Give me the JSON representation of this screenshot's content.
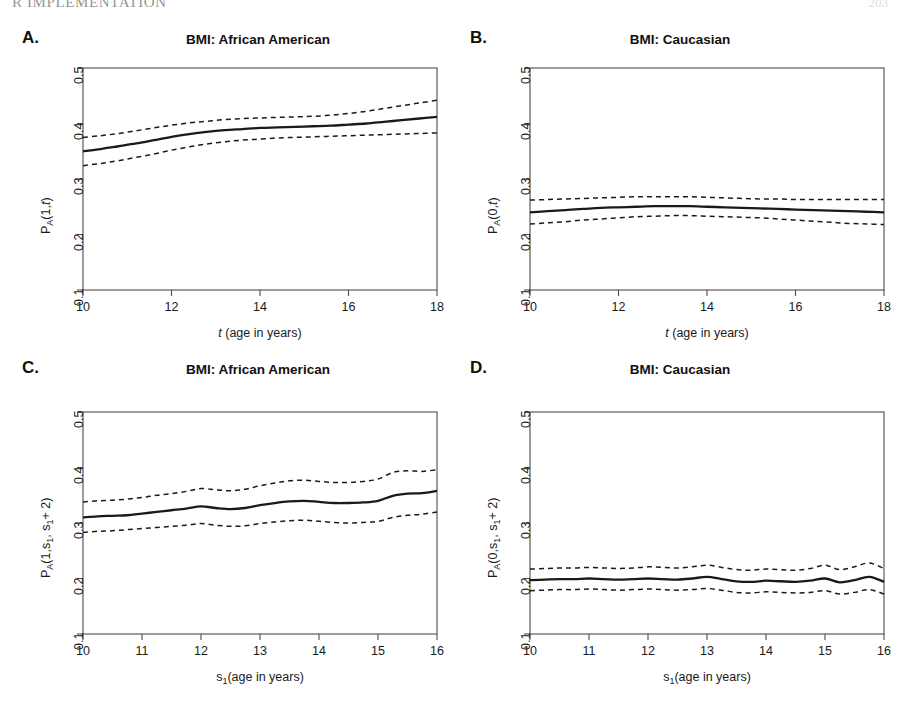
{
  "page": {
    "running_head": "R IMPLEMENTATION",
    "page_number": "203"
  },
  "figure": {
    "panels": [
      {
        "id": "a",
        "letter": "A.",
        "title": "BMI: African American",
        "ylabel_parts": {
          "base": "P",
          "sub": "A",
          "args": "(1,",
          "arg_italic": "t",
          "close": ")"
        },
        "xlabel_parts": {
          "italic": "t",
          "rest": " (age in years)"
        },
        "xticks": [
          "10",
          "12",
          "14",
          "16",
          "18"
        ],
        "yticks": [
          "0.1",
          "0.2",
          "0.3",
          "0.4",
          "0.5"
        ]
      },
      {
        "id": "b",
        "letter": "B.",
        "title": "BMI: Caucasian",
        "ylabel_parts": {
          "base": "P",
          "sub": "A",
          "args": "(0,",
          "arg_italic": "t",
          "close": ")"
        },
        "xlabel_parts": {
          "italic": "t",
          "rest": " (age in years)"
        },
        "xticks": [
          "10",
          "12",
          "14",
          "16",
          "18"
        ],
        "yticks": [
          "0.1",
          "0.2",
          "0.3",
          "0.4",
          "0.5"
        ]
      },
      {
        "id": "c",
        "letter": "C.",
        "title": "BMI: African American",
        "ylabel_parts": {
          "base": "P",
          "sub": "A",
          "args": "(1,s",
          "arg_sub": "1",
          "args2": ", s",
          "arg_sub2": "1",
          "close": "+ 2)"
        },
        "xlabel_parts": {
          "base": "s",
          "sub": "1",
          "rest": "(age in years)"
        },
        "xticks": [
          "10",
          "11",
          "12",
          "13",
          "14",
          "15",
          "16"
        ],
        "yticks": [
          "0.1",
          "0.2",
          "0.3",
          "0.4",
          "0.5"
        ]
      },
      {
        "id": "d",
        "letter": "D.",
        "title": "BMI: Caucasian",
        "ylabel_parts": {
          "base": "P",
          "sub": "A",
          "args": "(0,s",
          "arg_sub": "1",
          "args2": ", s",
          "arg_sub2": "1",
          "close": "+ 2)"
        },
        "xlabel_parts": {
          "base": "s",
          "sub": "1",
          "rest": "(age in years)"
        },
        "xticks": [
          "10",
          "11",
          "12",
          "13",
          "14",
          "15",
          "16"
        ],
        "yticks": [
          "0.1",
          "0.2",
          "0.3",
          "0.4",
          "0.5"
        ]
      }
    ]
  },
  "chart_data": [
    {
      "type": "line",
      "panel": "A",
      "title": "BMI: African American",
      "xlabel": "t (age in years)",
      "ylabel": "P_A(1,t)",
      "xlim": [
        10,
        18
      ],
      "ylim": [
        0.1,
        0.5
      ],
      "xticks": [
        10,
        12,
        14,
        16,
        18
      ],
      "yticks": [
        0.1,
        0.2,
        0.3,
        0.4,
        0.5
      ],
      "grid": false,
      "legend": "none",
      "x": [
        10.0,
        10.4,
        10.8,
        11.2,
        11.6,
        12.0,
        12.4,
        12.8,
        13.2,
        13.6,
        14.0,
        14.4,
        14.8,
        15.2,
        15.6,
        16.0,
        16.4,
        16.8,
        17.2,
        17.6,
        18.0
      ],
      "series": [
        {
          "name": "estimate",
          "style": "solid",
          "values": [
            0.35,
            0.354,
            0.359,
            0.364,
            0.37,
            0.376,
            0.381,
            0.385,
            0.388,
            0.39,
            0.392,
            0.393,
            0.394,
            0.395,
            0.396,
            0.398,
            0.4,
            0.403,
            0.406,
            0.409,
            0.412
          ]
        },
        {
          "name": "upper-confidence-band",
          "style": "dashed",
          "values": [
            0.375,
            0.378,
            0.382,
            0.387,
            0.392,
            0.397,
            0.401,
            0.404,
            0.407,
            0.409,
            0.41,
            0.411,
            0.412,
            0.413,
            0.415,
            0.418,
            0.422,
            0.427,
            0.432,
            0.437,
            0.442
          ]
        },
        {
          "name": "lower-confidence-band",
          "style": "dashed",
          "values": [
            0.324,
            0.328,
            0.333,
            0.339,
            0.345,
            0.352,
            0.358,
            0.363,
            0.367,
            0.37,
            0.372,
            0.374,
            0.375,
            0.376,
            0.377,
            0.378,
            0.379,
            0.38,
            0.381,
            0.382,
            0.383
          ]
        }
      ]
    },
    {
      "type": "line",
      "panel": "B",
      "title": "BMI: Caucasian",
      "xlabel": "t (age in years)",
      "ylabel": "P_A(0,t)",
      "xlim": [
        10,
        18
      ],
      "ylim": [
        0.1,
        0.5
      ],
      "xticks": [
        10,
        12,
        14,
        16,
        18
      ],
      "yticks": [
        0.1,
        0.2,
        0.3,
        0.4,
        0.5
      ],
      "grid": false,
      "legend": "none",
      "x": [
        10.0,
        10.4,
        10.8,
        11.2,
        11.6,
        12.0,
        12.4,
        12.8,
        13.2,
        13.6,
        14.0,
        14.4,
        14.8,
        15.2,
        15.6,
        16.0,
        16.4,
        16.8,
        17.2,
        17.6,
        18.0
      ],
      "series": [
        {
          "name": "estimate",
          "style": "solid",
          "values": [
            0.24,
            0.242,
            0.244,
            0.246,
            0.248,
            0.249,
            0.25,
            0.251,
            0.251,
            0.251,
            0.25,
            0.249,
            0.248,
            0.247,
            0.246,
            0.245,
            0.244,
            0.243,
            0.242,
            0.241,
            0.24
          ]
        },
        {
          "name": "upper-confidence-band",
          "style": "dashed",
          "values": [
            0.262,
            0.263,
            0.264,
            0.265,
            0.266,
            0.267,
            0.268,
            0.268,
            0.268,
            0.268,
            0.267,
            0.266,
            0.265,
            0.264,
            0.264,
            0.263,
            0.263,
            0.263,
            0.263,
            0.263,
            0.263
          ]
        },
        {
          "name": "lower-confidence-band",
          "style": "dashed",
          "values": [
            0.219,
            0.221,
            0.223,
            0.226,
            0.228,
            0.23,
            0.232,
            0.233,
            0.234,
            0.234,
            0.233,
            0.232,
            0.231,
            0.23,
            0.228,
            0.226,
            0.224,
            0.222,
            0.22,
            0.219,
            0.218
          ]
        }
      ]
    },
    {
      "type": "line",
      "panel": "C",
      "title": "BMI: African American",
      "xlabel": "s_1 (age in years)",
      "ylabel": "P_A(1,s_1, s_1 + 2)",
      "xlim": [
        10,
        16
      ],
      "ylim": [
        0.1,
        0.5
      ],
      "xticks": [
        10,
        11,
        12,
        13,
        14,
        15,
        16
      ],
      "yticks": [
        0.1,
        0.2,
        0.3,
        0.4,
        0.5
      ],
      "grid": false,
      "legend": "none",
      "x": [
        10.0,
        10.25,
        10.5,
        10.75,
        11.0,
        11.25,
        11.5,
        11.75,
        12.0,
        12.25,
        12.5,
        12.75,
        13.0,
        13.25,
        13.5,
        13.75,
        14.0,
        14.25,
        14.5,
        14.75,
        15.0,
        15.25,
        15.5,
        15.75,
        16.0
      ],
      "series": [
        {
          "name": "estimate",
          "style": "solid",
          "values": [
            0.31,
            0.312,
            0.313,
            0.314,
            0.317,
            0.32,
            0.323,
            0.326,
            0.33,
            0.327,
            0.325,
            0.327,
            0.332,
            0.336,
            0.339,
            0.34,
            0.338,
            0.336,
            0.336,
            0.337,
            0.34,
            0.349,
            0.353,
            0.354,
            0.358
          ]
        },
        {
          "name": "upper-confidence-band",
          "style": "dashed",
          "values": [
            0.338,
            0.34,
            0.341,
            0.343,
            0.346,
            0.35,
            0.353,
            0.357,
            0.362,
            0.36,
            0.358,
            0.361,
            0.367,
            0.372,
            0.376,
            0.377,
            0.375,
            0.373,
            0.373,
            0.375,
            0.379,
            0.391,
            0.394,
            0.393,
            0.396
          ]
        },
        {
          "name": "lower-confidence-band",
          "style": "dashed",
          "values": [
            0.283,
            0.285,
            0.286,
            0.288,
            0.29,
            0.292,
            0.294,
            0.296,
            0.299,
            0.296,
            0.294,
            0.295,
            0.299,
            0.302,
            0.304,
            0.305,
            0.303,
            0.301,
            0.3,
            0.301,
            0.303,
            0.31,
            0.314,
            0.316,
            0.32
          ]
        }
      ]
    },
    {
      "type": "line",
      "panel": "D",
      "title": "BMI: Caucasian",
      "xlabel": "s_1 (age in years)",
      "ylabel": "P_A(0,s_1, s_1 + 2)",
      "xlim": [
        10,
        16
      ],
      "ylim": [
        0.1,
        0.5
      ],
      "xticks": [
        10,
        11,
        12,
        13,
        14,
        15,
        16
      ],
      "yticks": [
        0.1,
        0.2,
        0.3,
        0.4,
        0.5
      ],
      "grid": false,
      "legend": "none",
      "x": [
        10.0,
        10.25,
        10.5,
        10.75,
        11.0,
        11.25,
        11.5,
        11.75,
        12.0,
        12.25,
        12.5,
        12.75,
        13.0,
        13.25,
        13.5,
        13.75,
        14.0,
        14.25,
        14.5,
        14.75,
        15.0,
        15.25,
        15.5,
        15.75,
        16.0
      ],
      "series": [
        {
          "name": "estimate",
          "style": "solid",
          "values": [
            0.197,
            0.198,
            0.199,
            0.199,
            0.2,
            0.199,
            0.198,
            0.199,
            0.2,
            0.199,
            0.198,
            0.2,
            0.203,
            0.199,
            0.195,
            0.194,
            0.196,
            0.195,
            0.194,
            0.196,
            0.2,
            0.193,
            0.197,
            0.203,
            0.194
          ]
        },
        {
          "name": "upper-confidence-band",
          "style": "dashed",
          "values": [
            0.217,
            0.218,
            0.219,
            0.219,
            0.22,
            0.219,
            0.218,
            0.219,
            0.221,
            0.22,
            0.219,
            0.221,
            0.224,
            0.22,
            0.216,
            0.215,
            0.217,
            0.216,
            0.215,
            0.218,
            0.224,
            0.216,
            0.221,
            0.228,
            0.218
          ]
        },
        {
          "name": "lower-confidence-band",
          "style": "dashed",
          "values": [
            0.178,
            0.179,
            0.18,
            0.18,
            0.181,
            0.18,
            0.179,
            0.18,
            0.181,
            0.18,
            0.179,
            0.18,
            0.182,
            0.179,
            0.175,
            0.174,
            0.176,
            0.175,
            0.174,
            0.175,
            0.178,
            0.172,
            0.175,
            0.18,
            0.172
          ]
        }
      ]
    }
  ],
  "style": {
    "line_color": "#1a1a1a",
    "axis_color": "#4d4d4d",
    "background": "#ffffff"
  }
}
